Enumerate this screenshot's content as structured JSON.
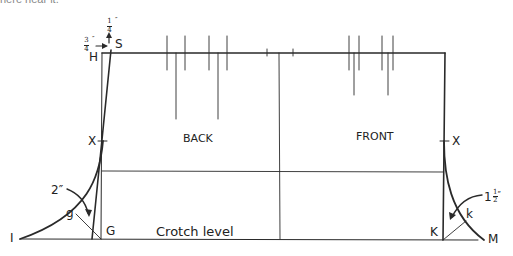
{
  "cropped_caption": "here near it.",
  "labels": {
    "S": "S",
    "H": "H",
    "X_left": "X",
    "X_right": "X",
    "back": "BACK",
    "front": "FRONT",
    "g": "g",
    "G": "G",
    "I": "I",
    "crotch_level": "Crotch level",
    "K": "K",
    "k": "k",
    "M": "M"
  },
  "measurements": {
    "top_arrow": {
      "num": "1",
      "den": "4",
      "unit": "″"
    },
    "side_arrow": {
      "num": "3",
      "den": "4",
      "unit": "″"
    },
    "back_crotch": "2″",
    "front_crotch": {
      "whole": "1",
      "num": "1",
      "den": "2",
      "unit": "″"
    }
  },
  "colors": {
    "line": "#2a2a2a",
    "thin_line": "#555555",
    "background": "#ffffff"
  }
}
